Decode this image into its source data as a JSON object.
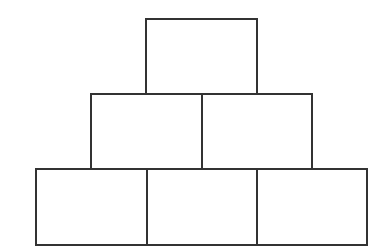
{
  "diagram": {
    "type": "block-pyramid",
    "stroke_color": "#333333",
    "background": "#ffffff",
    "stroke_width": 2,
    "rows": [
      {
        "name": "top-row",
        "boxes": [
          {
            "x": 145,
            "y": 18,
            "w": 113,
            "h": 77
          }
        ]
      },
      {
        "name": "middle-row",
        "boxes": [
          {
            "x": 90,
            "y": 93,
            "w": 113,
            "h": 77
          },
          {
            "x": 201,
            "y": 93,
            "w": 112,
            "h": 77
          }
        ]
      },
      {
        "name": "bottom-row",
        "boxes": [
          {
            "x": 35,
            "y": 168,
            "w": 113,
            "h": 78
          },
          {
            "x": 146,
            "y": 168,
            "w": 113,
            "h": 78
          },
          {
            "x": 256,
            "y": 168,
            "w": 112,
            "h": 78
          }
        ]
      }
    ]
  }
}
